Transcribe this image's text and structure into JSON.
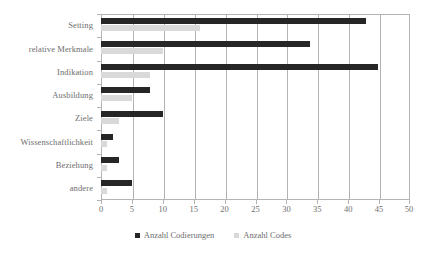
{
  "chart_data": {
    "type": "bar",
    "orientation": "horizontal",
    "title": "",
    "xlabel": "",
    "ylabel": "",
    "xlim": [
      0,
      50
    ],
    "xticks": [
      0,
      5,
      10,
      15,
      20,
      25,
      30,
      35,
      40,
      45,
      50
    ],
    "grid": true,
    "legend_position": "bottom",
    "categories": [
      "Setting",
      "relative Merkmale",
      "Indikation",
      "Ausbildung",
      "Ziele",
      "Wissenschaftlichkeit",
      "Beziehung",
      "andere"
    ],
    "series": [
      {
        "name": "Anzahl Codierungen",
        "color": "#262626",
        "values": [
          43,
          34,
          45,
          8,
          10,
          2,
          3,
          5
        ]
      },
      {
        "name": "Anzahl Codes",
        "color": "#d9d9d9",
        "values": [
          16,
          10,
          8,
          5,
          3,
          1,
          1,
          1
        ]
      }
    ]
  },
  "colors": {
    "series_dark": "#262626",
    "series_light": "#d9d9d9",
    "axis": "#b3b3b3",
    "text": "#6e6e6e",
    "background": "#ffffff"
  }
}
